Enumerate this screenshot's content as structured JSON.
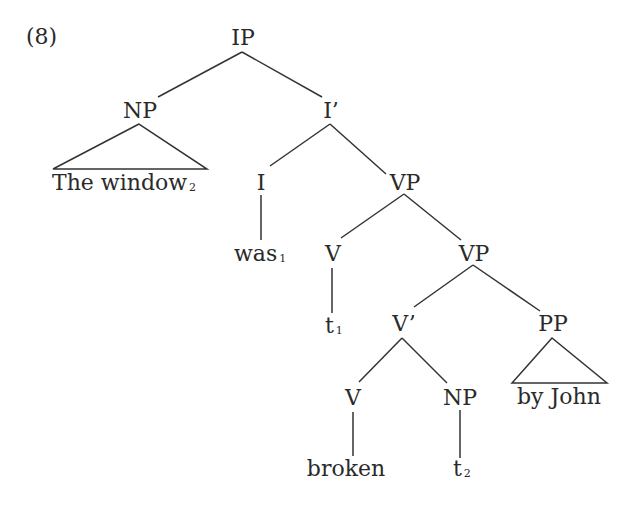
{
  "example_number": "(8)",
  "tree": {
    "ip": {
      "label": "IP"
    },
    "np_subject": {
      "label": "NP",
      "terminal": "The window",
      "index": "2"
    },
    "i_bar": {
      "label": "I’"
    },
    "i": {
      "label": "I",
      "terminal": "was",
      "index": "1"
    },
    "vp_upper": {
      "label": "VP"
    },
    "v_upper": {
      "label": "V",
      "terminal": "t",
      "index": "1"
    },
    "vp_lower": {
      "label": "VP"
    },
    "v_bar": {
      "label": "V’"
    },
    "pp": {
      "label": "PP",
      "terminal": "by John"
    },
    "v_lower": {
      "label": "V",
      "terminal": "broken"
    },
    "np_object": {
      "label": "NP",
      "terminal": "t",
      "index": "2"
    }
  },
  "colors": {
    "ink": "#2a2a2a",
    "lines": "#333333",
    "background": "#ffffff"
  }
}
